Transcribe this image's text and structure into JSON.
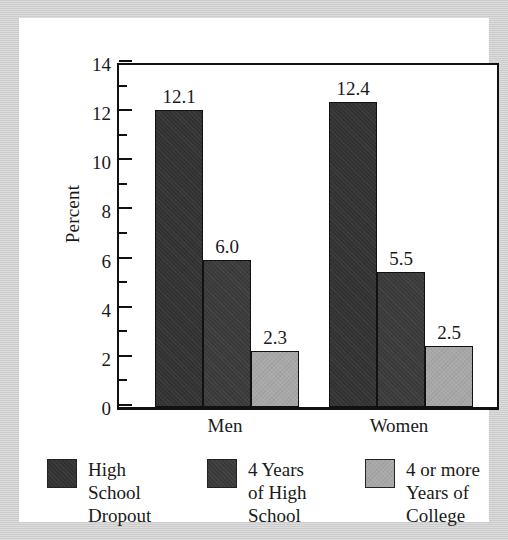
{
  "chart_data": {
    "type": "bar",
    "title": "",
    "subtitle": "",
    "xlabel": "",
    "ylabel": "Percent",
    "categories": [
      "Men",
      "Women"
    ],
    "series": [
      {
        "name": "High School Dropout",
        "legend_label": "High\nSchool\nDropout",
        "color": "#333333",
        "values": [
          12.1,
          6.0
        ],
        "value_labels": [
          "12.1",
          "6.0"
        ]
      },
      {
        "name": "4 Years of High School",
        "legend_label": "4 Years\nof High\nSchool",
        "color": "#3b3b3b",
        "values": [
          12.4,
          5.5
        ],
        "value_labels": [
          "12.4",
          "5.5"
        ]
      },
      {
        "name": "4 or more Years of College",
        "legend_label": "4 or more\nYears of\nCollege",
        "color": "#a8a8a8",
        "values": [
          2.3,
          2.5
        ],
        "value_labels": [
          "2.3",
          "2.5"
        ]
      }
    ],
    "grouped_values": {
      "Men": {
        "High School Dropout": 12.1,
        "4 Years of High School": 6.0,
        "4 or more Years of College": 2.3
      },
      "Women": {
        "High School Dropout": 12.4,
        "4 Years of High School": 5.5,
        "4 or more Years of College": 2.5
      }
    },
    "ylim": [
      0,
      14
    ],
    "ytick_labels": [
      "14",
      "12",
      "10",
      "8",
      "6",
      "4",
      "2",
      "0"
    ],
    "ytick_values": [
      14,
      12,
      10,
      8,
      6,
      4,
      2,
      0
    ],
    "yminor_values": [
      13,
      11,
      9,
      7,
      5,
      3,
      1
    ],
    "grid": false,
    "legend_position": "bottom"
  },
  "axis": {
    "y_title": "Percent"
  },
  "groups": [
    {
      "label": "Men",
      "bars": [
        {
          "series": "High School Dropout",
          "value": 12.1,
          "label": "12.1",
          "color": "#333333"
        },
        {
          "series": "4 Years of High School",
          "value": 6.0,
          "label": "6.0",
          "color": "#3b3b3b"
        },
        {
          "series": "4 or more Years of College",
          "value": 2.3,
          "label": "2.3",
          "color": "#a8a8a8"
        }
      ]
    },
    {
      "label": "Women",
      "bars": [
        {
          "series": "High School Dropout",
          "value": 12.4,
          "label": "12.4",
          "color": "#333333"
        },
        {
          "series": "4 Years of High School",
          "value": 5.5,
          "label": "5.5",
          "color": "#3b3b3b"
        },
        {
          "series": "4 or more Years of College",
          "value": 2.5,
          "label": "2.5",
          "color": "#a8a8a8"
        }
      ]
    }
  ],
  "legend": [
    {
      "label": "High\nSchool\nDropout",
      "color": "#333333"
    },
    {
      "label": "4 Years\nof High\nSchool",
      "color": "#3b3b3b"
    },
    {
      "label": "4 or more\nYears of\nCollege",
      "color": "#a8a8a8"
    }
  ],
  "colors": {
    "background": "#c9c9c9",
    "card": "#ffffff",
    "axis": "#111111",
    "text": "#1a1a1a"
  }
}
